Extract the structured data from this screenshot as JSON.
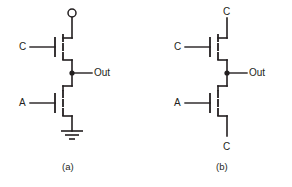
{
  "figure": {
    "background_color": "#ffffff",
    "ink_color": "#231f20",
    "width": 292,
    "height": 187
  },
  "circuits": [
    {
      "id": "a",
      "caption": "(a)",
      "caption_pos": {
        "x": 62,
        "y": 163
      },
      "supply_terminal": {
        "type": "open-circle",
        "cx": 72,
        "cy": 13,
        "r": 4
      },
      "ground_terminal": {
        "type": "ground-symbol",
        "x": 72,
        "y": 131
      },
      "output_node": {
        "label": "Out",
        "label_pos": {
          "x": 94,
          "y": 69
        },
        "dot": {
          "cx": 72,
          "cy": 73,
          "r": 2.6
        }
      },
      "transistors": [
        {
          "name": "top-transistor",
          "gate_label": "C",
          "gate_label_pos": {
            "x": 19,
            "y": 43
          },
          "gate_wire": {
            "x1": 30,
            "y1": 47,
            "x2": 55,
            "y2": 47
          }
        },
        {
          "name": "bottom-transistor",
          "gate_label": "A",
          "gate_label_pos": {
            "x": 19,
            "y": 99
          },
          "gate_wire": {
            "x1": 30,
            "y1": 103,
            "x2": 55,
            "y2": 103
          }
        }
      ]
    },
    {
      "id": "b",
      "caption": "(b)",
      "caption_pos": {
        "x": 216,
        "y": 163
      },
      "top_terminal": {
        "label": "C",
        "label_pos": {
          "x": 224,
          "y": 8
        }
      },
      "bottom_terminal": {
        "label": "C",
        "label_pos": {
          "x": 224,
          "y": 143
        }
      },
      "output_node": {
        "label": "Out",
        "label_pos": {
          "x": 249,
          "y": 69
        },
        "dot": {
          "cx": 227,
          "cy": 73,
          "r": 2.6
        }
      },
      "transistors": [
        {
          "name": "top-transistor",
          "gate_label": "C",
          "gate_label_pos": {
            "x": 174,
            "y": 43
          },
          "gate_wire": {
            "x1": 185,
            "y1": 47,
            "x2": 210,
            "y2": 47
          }
        },
        {
          "name": "bottom-transistor",
          "gate_label": "A",
          "gate_label_pos": {
            "x": 174,
            "y": 99
          },
          "gate_wire": {
            "x1": 185,
            "y1": 103,
            "x2": 210,
            "y2": 103
          }
        }
      ]
    }
  ]
}
